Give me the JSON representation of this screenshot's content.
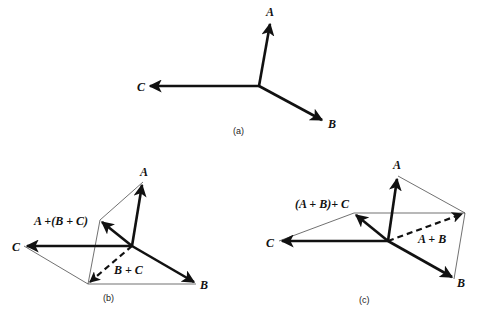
{
  "diagrams": {
    "a": {
      "caption": "(a)",
      "labels": {
        "A": "A",
        "B": "B",
        "C": "C"
      }
    },
    "b": {
      "caption": "(b)",
      "labels": {
        "A": "A",
        "B": "B",
        "C": "C",
        "BC": "B + C",
        "sum": "A +(B + C)"
      }
    },
    "c": {
      "caption": "(c)",
      "labels": {
        "A": "A",
        "B": "B",
        "C": "C",
        "AB": "A + B",
        "sum": "(A + B)+ C"
      }
    }
  },
  "colors": {
    "ink": "#111111",
    "background": "#ffffff"
  }
}
